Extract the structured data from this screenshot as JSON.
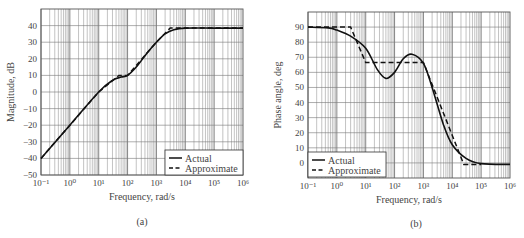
{
  "chart_data": [
    {
      "id": "a",
      "type": "line",
      "title": "",
      "caption": "(a)",
      "xlabel": "Frequency, rad/s",
      "ylabel": "Magnitude, dB",
      "xscale": "log",
      "xlim": [
        0.1,
        1000000
      ],
      "ylim": [
        -50,
        50
      ],
      "x_tick_labels": [
        "10⁻¹",
        "10⁰",
        "10¹",
        "10²",
        "10³",
        "10⁴",
        "10⁵",
        "10⁶"
      ],
      "x_ticks": [
        0.1,
        1,
        10,
        100,
        1000,
        10000,
        100000,
        1000000
      ],
      "y_ticks": [
        -50,
        -40,
        -30,
        -20,
        -10,
        0,
        10,
        20,
        30,
        40
      ],
      "grid": true,
      "legend": {
        "position": "lower right",
        "entries": [
          "Actual",
          "Approximate"
        ]
      },
      "series": [
        {
          "name": "Actual",
          "style": "solid",
          "x": [
            0.1,
            1,
            10,
            30,
            60,
            100,
            200,
            500,
            1000,
            2000,
            4000,
            10000,
            100000,
            1000000
          ],
          "y": [
            -40,
            -20,
            0,
            7,
            9,
            10,
            15,
            24,
            30,
            35,
            37.5,
            38.5,
            38.5,
            38.5
          ]
        },
        {
          "name": "Approximate",
          "style": "dashed",
          "x": [
            0.1,
            1,
            10,
            50,
            100,
            1000,
            3000,
            10000,
            100000,
            1000000
          ],
          "y": [
            -40,
            -20,
            0,
            10,
            10,
            30,
            38.5,
            38.5,
            38.5,
            38.5
          ]
        }
      ]
    },
    {
      "id": "b",
      "type": "line",
      "title": "",
      "caption": "(b)",
      "xlabel": "Frequency, rad/s",
      "ylabel": "Phase angle, deg",
      "xscale": "log",
      "xlim": [
        0.1,
        1000000
      ],
      "ylim": [
        -10,
        100
      ],
      "x_tick_labels": [
        "10⁻¹",
        "10⁰",
        "10¹",
        "10²",
        "10³",
        "10⁴",
        "10⁵",
        "10⁶"
      ],
      "x_ticks": [
        0.1,
        1,
        10,
        100,
        1000,
        10000,
        100000,
        1000000
      ],
      "y_ticks": [
        0,
        10,
        20,
        30,
        40,
        50,
        60,
        70,
        80,
        90
      ],
      "grid": true,
      "legend": {
        "position": "lower left",
        "entries": [
          "Actual",
          "Approximate"
        ]
      },
      "series": [
        {
          "name": "Actual",
          "style": "solid",
          "x": [
            0.1,
            0.5,
            1,
            3,
            10,
            25,
            50,
            100,
            200,
            400,
            1000,
            2000,
            5000,
            10000,
            30000,
            100000,
            1000000
          ],
          "y": [
            90,
            89.5,
            88,
            84,
            76,
            62,
            56,
            60,
            69,
            72,
            66,
            50,
            25,
            12,
            3,
            -0.5,
            -1
          ]
        },
        {
          "name": "Approximate",
          "style": "dashed",
          "x": [
            0.1,
            3,
            10,
            1000,
            25000,
            100000
          ],
          "y": [
            90,
            90,
            66.5,
            66.5,
            -1,
            -1
          ]
        }
      ]
    }
  ]
}
